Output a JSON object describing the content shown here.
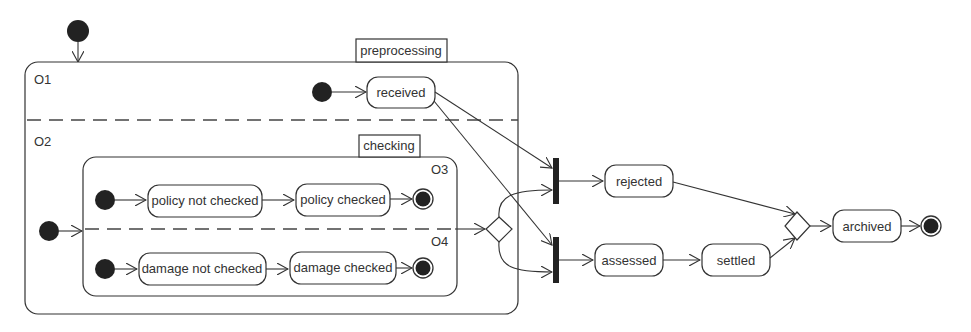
{
  "diagram": {
    "type": "uml-state-machine",
    "composite_states": {
      "preprocessing": "preprocessing",
      "checking": "checking"
    },
    "regions": {
      "o1": "O1",
      "o2": "O2",
      "o3": "O3",
      "o4": "O4"
    },
    "states": {
      "received": "received",
      "policy_not_checked": "policy not checked",
      "policy_checked": "policy checked",
      "damage_not_checked": "damage not checked",
      "damage_checked": "damage checked",
      "rejected": "rejected",
      "assessed": "assessed",
      "settled": "settled",
      "archived": "archived"
    },
    "transitions": [
      {
        "from": "initial",
        "to": "preprocessing"
      },
      {
        "from": "initial-O1",
        "to": "received"
      },
      {
        "from": "initial-O2",
        "to": "checking"
      },
      {
        "from": "initial-O3",
        "to": "policy not checked"
      },
      {
        "from": "policy not checked",
        "to": "policy checked"
      },
      {
        "from": "policy checked",
        "to": "final-O3"
      },
      {
        "from": "initial-O4",
        "to": "damage not checked"
      },
      {
        "from": "damage not checked",
        "to": "damage checked"
      },
      {
        "from": "damage checked",
        "to": "final-O4"
      },
      {
        "from": "checking",
        "to": "choice"
      },
      {
        "from": "received",
        "to": "join-reject"
      },
      {
        "from": "received",
        "to": "join-assess"
      },
      {
        "from": "choice",
        "to": "join-reject"
      },
      {
        "from": "choice",
        "to": "join-assess"
      },
      {
        "from": "join-reject",
        "to": "rejected"
      },
      {
        "from": "join-assess",
        "to": "assessed"
      },
      {
        "from": "assessed",
        "to": "settled"
      },
      {
        "from": "rejected",
        "to": "merge"
      },
      {
        "from": "settled",
        "to": "merge"
      },
      {
        "from": "merge",
        "to": "archived"
      },
      {
        "from": "archived",
        "to": "final"
      }
    ]
  }
}
